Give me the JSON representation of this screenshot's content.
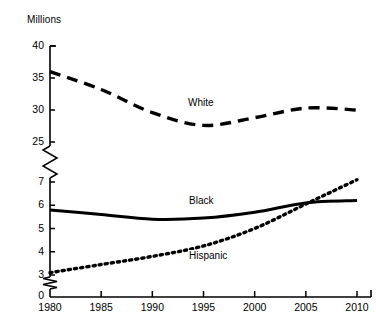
{
  "chart_data": {
    "type": "line",
    "title": "",
    "subtitle": "",
    "xlabel": "",
    "ylabel": "Millions",
    "axis_unit_label": "Millions",
    "x": [
      1980,
      1985,
      1990,
      1995,
      2000,
      2005,
      2010
    ],
    "xtick_labels": [
      "1980",
      "1985",
      "1990",
      "1995",
      "2000",
      "2005",
      "2010"
    ],
    "xlim": [
      1980,
      2010
    ],
    "grid": false,
    "legend_position": "inline-labels",
    "broken_axis": true,
    "y_upper_ticks": [
      25,
      30,
      35,
      40
    ],
    "y_upper_tick_labels": [
      "25",
      "30",
      "35",
      "40"
    ],
    "y_lower_ticks": [
      0,
      3,
      4,
      5,
      6,
      7
    ],
    "y_lower_tick_labels": [
      "0",
      "3",
      "4",
      "5",
      "6",
      "7"
    ],
    "y_upper_range": [
      25,
      40
    ],
    "y_lower_range": [
      3,
      7
    ],
    "axis_breaks": [
      "between 25 and 7",
      "between 3 and 0"
    ],
    "series": [
      {
        "name": "White",
        "label": "White",
        "style": "dashed",
        "color": "#000000",
        "values": [
          36.0,
          33.2,
          29.6,
          27.6,
          28.8,
          30.3,
          30.0
        ]
      },
      {
        "name": "Black",
        "label": "Black",
        "style": "solid",
        "color": "#000000",
        "values": [
          5.8,
          5.6,
          5.4,
          5.45,
          5.7,
          6.1,
          6.2
        ]
      },
      {
        "name": "Hispanic",
        "label": "Hispanic",
        "style": "dotted",
        "color": "#000000",
        "values": [
          3.1,
          3.45,
          3.8,
          4.25,
          5.0,
          6.05,
          7.1
        ]
      }
    ]
  }
}
